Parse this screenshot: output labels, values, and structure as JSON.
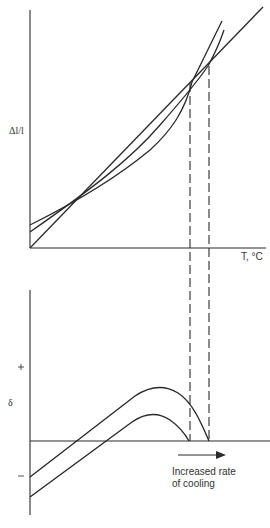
{
  "diagram": {
    "top_panel": {
      "y_axis_label": "Δl/l",
      "x_axis_label": "T, °C",
      "curves": [
        {
          "name": "straight-line",
          "description": "linear expansion line through origin"
        },
        {
          "name": "curve-upper",
          "description": "expansion curve with higher intercept"
        },
        {
          "name": "curve-lower",
          "description": "expansion curve with lower intercept"
        }
      ],
      "dashed_markers": 2
    },
    "bottom_panel": {
      "y_axis_label": "δ",
      "plus_tick": "+",
      "minus_tick": "−",
      "curves": [
        {
          "name": "delta-curve-upper"
        },
        {
          "name": "delta-curve-lower"
        }
      ],
      "annotation_line1": "Increased rate",
      "annotation_line2": "of cooling"
    },
    "colors": {
      "line": "#2a2a2a",
      "text": "#333333",
      "background": "#ffffff"
    }
  }
}
